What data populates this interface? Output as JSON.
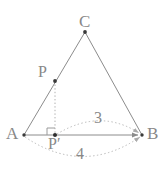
{
  "figure": {
    "type": "geometry-diagram",
    "colors": {
      "stroke": "#8c8c8c",
      "dotted": "#b0b0b0",
      "label": "#888888",
      "background": "#ffffff"
    },
    "points": [
      {
        "id": "A",
        "label": "A",
        "x": 24,
        "y": 135
      },
      {
        "id": "B",
        "label": "B",
        "x": 142,
        "y": 135
      },
      {
        "id": "C",
        "label": "C",
        "x": 85,
        "y": 32
      },
      {
        "id": "P",
        "label": "P",
        "x": 55,
        "y": 81
      },
      {
        "id": "Pp",
        "label": "P′",
        "x": 55,
        "y": 135
      }
    ],
    "segments": [
      {
        "id": "AC",
        "from": "A",
        "to": "C",
        "style": "solid"
      },
      {
        "id": "CB",
        "from": "C",
        "to": "B",
        "style": "solid"
      },
      {
        "id": "AB",
        "from": "A",
        "to": "B",
        "style": "solid",
        "arrow": "end"
      },
      {
        "id": "PPp",
        "from": "P",
        "to": "Pp",
        "style": "dotted"
      }
    ],
    "right_angle": {
      "at": "Pp",
      "between": [
        "PPp",
        "AB"
      ]
    },
    "arcs": [
      {
        "id": "arc-3",
        "label": "3",
        "from": "Pp",
        "to": "B",
        "side": "above",
        "style": "dotted",
        "arrow": "end"
      },
      {
        "id": "arc-4",
        "label": "4",
        "from": "A",
        "to": "B",
        "side": "below",
        "style": "dotted",
        "arrow": "end"
      }
    ],
    "labels": {
      "A": "A",
      "B": "B",
      "C": "C",
      "P": "P",
      "P_prime": "P′",
      "measure_top": "3",
      "measure_bottom": "4"
    }
  }
}
